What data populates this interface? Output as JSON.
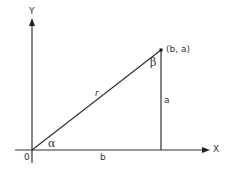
{
  "diagram": {
    "type": "right-triangle-coordinate-plane",
    "axes": {
      "x_label": "X",
      "y_label": "Y",
      "origin_label": "0"
    },
    "point_label": "(b, a)",
    "sides": {
      "hypotenuse": "r",
      "vertical": "a",
      "horizontal": "b"
    },
    "angles": {
      "at_origin": "α",
      "at_point": "β"
    },
    "colors": {
      "line": "#333333",
      "background": "#ffffff"
    }
  }
}
